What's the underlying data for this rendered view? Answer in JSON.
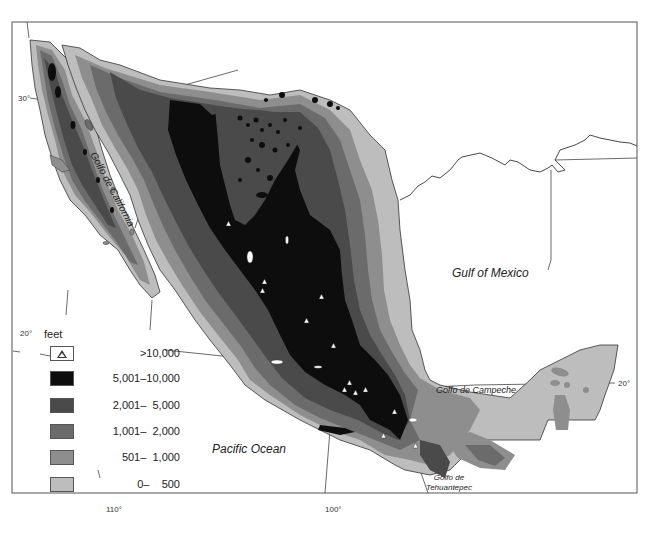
{
  "map": {
    "title": "Relief map of Mexico",
    "labels": {
      "gulf_of_mexico": "Gulf of Mexico",
      "pacific_ocean": "Pacific Ocean",
      "golfo_de_california": "Golfo de California",
      "golfo_de_campeche": "Golfo de Campeche",
      "golfo_de_tehuantepec_line1": "Golfo de",
      "golfo_de_tehuantepec_line2": "Tehuantepec"
    },
    "coordinates": {
      "lat_30": "30°",
      "lat_20_left": "20°",
      "lat_20_right": "20°",
      "lon_110": "110°",
      "lon_100": "100°"
    }
  },
  "legend": {
    "unit": "feet",
    "items": [
      {
        "label": ">10,000",
        "symbol": "triangle-icon",
        "color": "#ffffff"
      },
      {
        "label": "5,001–10,000",
        "color": "#0d0d0d"
      },
      {
        "label": "2,001–  5,000",
        "color": "#4a4a4a"
      },
      {
        "label": "1,001–  2,000",
        "color": "#6b6b6b"
      },
      {
        "label": "501–  1,000",
        "color": "#8e8e8e"
      },
      {
        "label": "0–    500",
        "color": "#bdbdbd"
      }
    ]
  },
  "colors": {
    "frame": "#555555",
    "coast": "#333333",
    "water": "#ffffff"
  }
}
